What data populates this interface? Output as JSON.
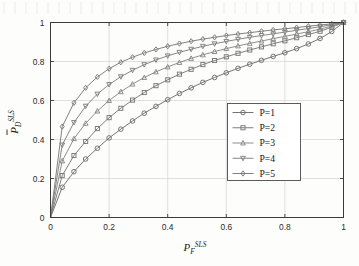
{
  "chart_data": {
    "type": "line",
    "title": "",
    "subtitle": "",
    "xlabel": "P_F^{SLS}",
    "xlabel_parts": {
      "base": "P",
      "sub": "F",
      "sup": "SLS"
    },
    "ylabel": "P_D^{SLS}",
    "ylabel_parts": {
      "base": "P",
      "sub": "D",
      "sup": "SLS",
      "overbar": true
    },
    "xlim": [
      0,
      1
    ],
    "ylim": [
      0,
      1
    ],
    "xticks": [
      0,
      0.2,
      0.4,
      0.6,
      0.8,
      1
    ],
    "yticks": [
      0,
      0.2,
      0.4,
      0.6,
      0.8,
      1
    ],
    "xtick_labels": [
      "0",
      "0.2",
      "0.4",
      "0.6",
      "0.8",
      "1"
    ],
    "ytick_labels": [
      "0",
      "0.2",
      "0.4",
      "0.6",
      "0.8",
      "1"
    ],
    "grid": true,
    "legend_position": "center-right",
    "box": true,
    "x": [
      0,
      0.04,
      0.08,
      0.12,
      0.16,
      0.2,
      0.24,
      0.28,
      0.32,
      0.36,
      0.4,
      0.44,
      0.48,
      0.52,
      0.56,
      0.6,
      0.64,
      0.68,
      0.72,
      0.76,
      0.8,
      0.84,
      0.88,
      0.92,
      0.96,
      1.0
    ],
    "series": [
      {
        "name": "P=1",
        "marker": "circle",
        "color": "#6e6e6e",
        "values": [
          0,
          0.155,
          0.235,
          0.3,
          0.355,
          0.408,
          0.453,
          0.495,
          0.535,
          0.57,
          0.604,
          0.636,
          0.665,
          0.693,
          0.718,
          0.742,
          0.765,
          0.786,
          0.806,
          0.826,
          0.845,
          0.866,
          0.89,
          0.918,
          0.954,
          1.0
        ]
      },
      {
        "name": "P=2",
        "marker": "square",
        "color": "#787878",
        "values": [
          0,
          0.215,
          0.318,
          0.39,
          0.456,
          0.512,
          0.56,
          0.602,
          0.641,
          0.676,
          0.706,
          0.735,
          0.76,
          0.784,
          0.805,
          0.824,
          0.842,
          0.859,
          0.875,
          0.891,
          0.906,
          0.922,
          0.938,
          0.955,
          0.976,
          1.0
        ]
      },
      {
        "name": "P=3",
        "marker": "triangle-up",
        "color": "#888888",
        "values": [
          0,
          0.29,
          0.404,
          0.483,
          0.546,
          0.6,
          0.645,
          0.684,
          0.718,
          0.747,
          0.772,
          0.795,
          0.816,
          0.834,
          0.851,
          0.866,
          0.88,
          0.893,
          0.905,
          0.917,
          0.929,
          0.941,
          0.953,
          0.966,
          0.982,
          1.0
        ]
      },
      {
        "name": "P=4",
        "marker": "triangle-down",
        "color": "#808080",
        "values": [
          0,
          0.372,
          0.487,
          0.571,
          0.633,
          0.682,
          0.722,
          0.755,
          0.784,
          0.808,
          0.829,
          0.847,
          0.863,
          0.878,
          0.891,
          0.903,
          0.914,
          0.924,
          0.933,
          0.942,
          0.951,
          0.96,
          0.969,
          0.978,
          0.989,
          1.0
        ]
      },
      {
        "name": "P=5",
        "marker": "diamond",
        "color": "#7a7a7a",
        "values": [
          0,
          0.466,
          0.588,
          0.665,
          0.721,
          0.763,
          0.796,
          0.822,
          0.844,
          0.862,
          0.878,
          0.892,
          0.904,
          0.915,
          0.924,
          0.933,
          0.941,
          0.948,
          0.955,
          0.962,
          0.968,
          0.974,
          0.981,
          0.987,
          0.993,
          1.0
        ]
      }
    ]
  },
  "legend": {
    "items": [
      {
        "label": "P=1",
        "marker": "circle"
      },
      {
        "label": "P=2",
        "marker": "square"
      },
      {
        "label": "P=3",
        "marker": "triangle-up"
      },
      {
        "label": "P=4",
        "marker": "triangle-down"
      },
      {
        "label": "P=5",
        "marker": "diamond"
      }
    ]
  },
  "colors": {
    "axis": "#3a3a3a",
    "grid": "#d2d2d2",
    "background": "#fdfdfc",
    "text": "#1d1d1d"
  }
}
